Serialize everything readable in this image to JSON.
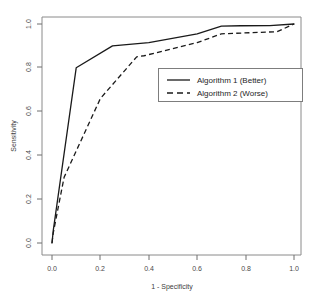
{
  "chart_data": {
    "type": "line",
    "title": "",
    "xlabel": "1 - Specificity",
    "ylabel": "Sensitivity",
    "xlim": [
      0,
      1
    ],
    "ylim": [
      0,
      1
    ],
    "grid": false,
    "legend_position": "center-right",
    "xticks": [
      "0.0",
      "0.2",
      "0.4",
      "0.6",
      "0.8",
      "1.0"
    ],
    "xtick_values": [
      0.0,
      0.2,
      0.4,
      0.6,
      0.8,
      1.0
    ],
    "yticks": [
      "0.0",
      "0.2",
      "0.4",
      "0.6",
      "0.8",
      "1.0"
    ],
    "ytick_values": [
      0.0,
      0.2,
      0.4,
      0.6,
      0.8,
      1.0
    ],
    "series": [
      {
        "name": "Algorithm 1 (Better)",
        "style": "solid",
        "color": "#1a1a1a",
        "x": [
          0.0,
          0.005,
          0.1,
          0.25,
          0.4,
          0.6,
          0.7,
          0.78,
          0.9,
          1.0
        ],
        "y": [
          0.0,
          0.055,
          0.8,
          0.9,
          0.915,
          0.955,
          0.99,
          0.992,
          0.993,
          1.0
        ]
      },
      {
        "name": "Algorithm 2 (Worse)",
        "style": "dashed",
        "color": "#1a1a1a",
        "x": [
          0.0,
          0.005,
          0.05,
          0.2,
          0.35,
          0.38,
          0.6,
          0.7,
          0.86,
          0.93,
          1.0
        ],
        "y": [
          0.0,
          0.045,
          0.3,
          0.66,
          0.85,
          0.855,
          0.915,
          0.955,
          0.962,
          0.965,
          1.0
        ]
      }
    ]
  },
  "legend": {
    "entries": [
      {
        "label": "Algorithm 1 (Better)",
        "style": "solid"
      },
      {
        "label": "Algorithm 2 (Worse)",
        "style": "dashed"
      }
    ]
  },
  "axes": {
    "x_title": "1 - Specificity",
    "y_title": "Sensitivity",
    "x_tick_labels": [
      "0.0",
      "0.2",
      "0.4",
      "0.6",
      "0.8",
      "1.0"
    ],
    "y_tick_labels": [
      "0.0",
      "0.2",
      "0.4",
      "0.6",
      "0.8",
      "1.0"
    ]
  }
}
